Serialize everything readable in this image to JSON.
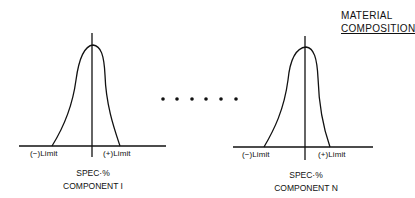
{
  "title": {
    "line1": "MATERIAL",
    "line2": "COMPOSITION"
  },
  "charts": [
    {
      "name": "component-1",
      "minus_limit": "(−)Limit",
      "plus_limit": "(+)Limit",
      "spec_label": "SPEC·%",
      "component_label": "COMPONENT I"
    },
    {
      "name": "component-n",
      "minus_limit": "(−)Limit",
      "plus_limit": "(+)Limit",
      "spec_label": "SPEC·%",
      "component_label": "COMPONENT N"
    }
  ],
  "ellipsis": {
    "dot_count": 6
  }
}
